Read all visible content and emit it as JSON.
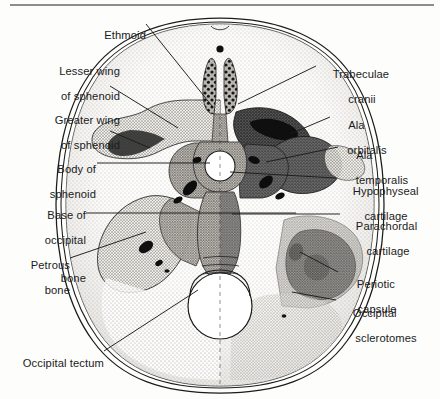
{
  "figure": {
    "background_color": "#fdfdfc",
    "ink_color": "#1b1b1b",
    "top_rule_color": "#8d8d8d"
  },
  "labels": {
    "ethmoid": {
      "line1": "Ethmoid",
      "line2": ""
    },
    "lesser_wing": {
      "line1": "Lesser wing",
      "line2": "of sphenoid"
    },
    "greater_wing": {
      "line1": "Greater wing",
      "line2": "of sphenoid"
    },
    "body_sphenoid": {
      "line1": "Body of",
      "line2": "sphenoid"
    },
    "base_occipital": {
      "line1": "Base of",
      "line2": "occipital",
      "line3": "bone"
    },
    "petrous_bone": {
      "line1": "Petrous",
      "line2": "bone"
    },
    "occipital_tectum": {
      "line1": "Occipital tectum",
      "line2": ""
    },
    "trabeculae_cranii": {
      "line1": "Trabeculae",
      "line2": "cranii"
    },
    "ala_orbitalis": {
      "line1": "Ala",
      "line2": "orbitalis"
    },
    "ala_temporalis": {
      "line1": "Ala",
      "line2": "temporalis"
    },
    "hypophyseal_cartilage": {
      "line1": "Hypophyseal",
      "line2": "cartilage"
    },
    "parachordal_cartilage": {
      "line1": "Parachordal",
      "line2": "cartilage"
    },
    "periotic_capsule": {
      "line1": "Periotic",
      "line2": "capsule"
    },
    "occipital_sclerotomes": {
      "line1": "Occipital",
      "line2": "sclerotomes"
    }
  },
  "structures": {
    "cranial_vault": "skull outline, double contour",
    "foramen_magnum": "large central opening, inferior",
    "hypophyseal_fossa": "small central circular opening",
    "left_half": "membranous bone, light stipple",
    "right_half": "cartilage, dark grey"
  },
  "palette": {
    "outline": "#1b1b1b",
    "bone_light": "#e8e6e2",
    "bone_mid": "#cfccc6",
    "cartilage_dark": "#5d5d5d",
    "cartilage_darker": "#464646",
    "black_mass": "#111111",
    "open_white": "#ffffff"
  }
}
